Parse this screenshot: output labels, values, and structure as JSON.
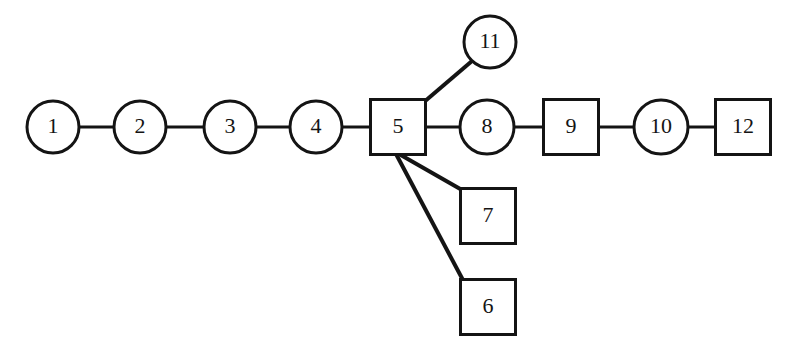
{
  "diagram": {
    "type": "node-link-graph",
    "background_color": "#ffffff",
    "stroke_color": "#141414",
    "fill_color": "#ffffff",
    "width": 798,
    "height": 353,
    "nodes": [
      {
        "id": "1",
        "label": "1",
        "shape": "circle",
        "cx": 53,
        "cy": 127,
        "r": 26,
        "font_size": 22
      },
      {
        "id": "2",
        "label": "2",
        "shape": "circle",
        "cx": 140,
        "cy": 127,
        "r": 26,
        "font_size": 22
      },
      {
        "id": "3",
        "label": "3",
        "shape": "circle",
        "cx": 230,
        "cy": 127,
        "r": 26,
        "font_size": 22
      },
      {
        "id": "4",
        "label": "4",
        "shape": "circle",
        "cx": 316,
        "cy": 127,
        "r": 26,
        "font_size": 22
      },
      {
        "id": "5",
        "label": "5",
        "shape": "square",
        "cx": 398,
        "cy": 127,
        "size": 55,
        "font_size": 22
      },
      {
        "id": "6",
        "label": "6",
        "shape": "square",
        "cx": 488,
        "cy": 307,
        "size": 55,
        "font_size": 22
      },
      {
        "id": "7",
        "label": "7",
        "shape": "square",
        "cx": 488,
        "cy": 216,
        "size": 55,
        "font_size": 22
      },
      {
        "id": "8",
        "label": "8",
        "shape": "circle",
        "cx": 487,
        "cy": 127,
        "r": 27,
        "font_size": 22
      },
      {
        "id": "9",
        "label": "9",
        "shape": "square",
        "cx": 571,
        "cy": 127,
        "size": 55,
        "font_size": 22
      },
      {
        "id": "10",
        "label": "10",
        "shape": "circle",
        "cx": 661,
        "cy": 127,
        "r": 27,
        "font_size": 22
      },
      {
        "id": "11",
        "label": "11",
        "shape": "circle",
        "cx": 490,
        "cy": 42,
        "r": 26,
        "font_size": 22
      },
      {
        "id": "12",
        "label": "12",
        "shape": "square",
        "cx": 743,
        "cy": 127,
        "size": 55,
        "font_size": 22
      }
    ],
    "edges": [
      {
        "id": "e1-2",
        "from": "1",
        "to": "2",
        "x1": 79,
        "y1": 127,
        "x2": 114,
        "y2": 127,
        "width": 3
      },
      {
        "id": "e2-3",
        "from": "2",
        "to": "3",
        "x1": 166,
        "y1": 127,
        "x2": 204,
        "y2": 127,
        "width": 3
      },
      {
        "id": "e3-4",
        "from": "3",
        "to": "4",
        "x1": 256,
        "y1": 127,
        "x2": 290,
        "y2": 127,
        "width": 3
      },
      {
        "id": "e4-5",
        "from": "4",
        "to": "5",
        "x1": 342,
        "y1": 127,
        "x2": 371,
        "y2": 127,
        "width": 3
      },
      {
        "id": "e5-8",
        "from": "5",
        "to": "8",
        "x1": 426,
        "y1": 127,
        "x2": 460,
        "y2": 127,
        "width": 3
      },
      {
        "id": "e8-9",
        "from": "8",
        "to": "9",
        "x1": 514,
        "y1": 127,
        "x2": 544,
        "y2": 127,
        "width": 3
      },
      {
        "id": "e9-10",
        "from": "9",
        "to": "10",
        "x1": 598,
        "y1": 127,
        "x2": 634,
        "y2": 127,
        "width": 3
      },
      {
        "id": "e10-12",
        "from": "10",
        "to": "12",
        "x1": 688,
        "y1": 127,
        "x2": 716,
        "y2": 127,
        "width": 3
      },
      {
        "id": "e5-11",
        "from": "5",
        "to": "11",
        "x1": 424,
        "y1": 102,
        "x2": 472,
        "y2": 61,
        "width": 4
      },
      {
        "id": "e5-7",
        "from": "5",
        "to": "7",
        "x1": 399,
        "y1": 154,
        "x2": 462,
        "y2": 190,
        "width": 4
      },
      {
        "id": "e5-6",
        "from": "5",
        "to": "6",
        "x1": 396,
        "y1": 154,
        "x2": 464,
        "y2": 282,
        "width": 4
      }
    ]
  }
}
